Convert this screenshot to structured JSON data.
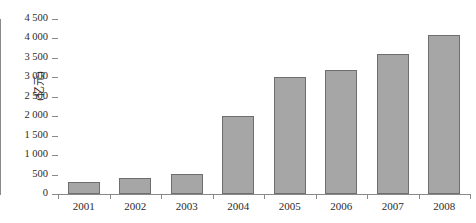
{
  "chart_data": {
    "type": "bar",
    "title": "",
    "xlabel": "",
    "ylabel": "(亿元)",
    "categories": [
      "2001",
      "2002",
      "2003",
      "2004",
      "2005",
      "2006",
      "2007",
      "2008"
    ],
    "values": [
      300,
      400,
      520,
      2000,
      3000,
      3200,
      3600,
      4100
    ],
    "ylim": [
      0,
      4500
    ],
    "ytick_values": [
      0,
      500,
      1000,
      1500,
      2000,
      2500,
      3000,
      3500,
      4000,
      4500
    ],
    "ytick_labels": [
      "0",
      "500",
      "1 000",
      "1 500",
      "2 000",
      "2 500",
      "3 000",
      "3 500",
      "4 000",
      "4 500"
    ],
    "grid": false,
    "legend": null,
    "series": [
      {
        "name": "",
        "values": [
          300,
          400,
          520,
          2000,
          3000,
          3200,
          3600,
          4100
        ]
      }
    ],
    "colors": {
      "bar_fill": "#a6a6a6",
      "bar_border": "#6e6e6e",
      "axis": "#8a8a8a",
      "text": "#2b2b2b",
      "background": "#ffffff"
    }
  }
}
